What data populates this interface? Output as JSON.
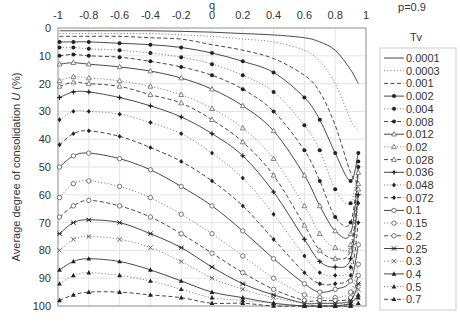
{
  "chart_data": {
    "type": "line",
    "title": "",
    "annotation": "p=0.9",
    "xlabel": "q",
    "ylabel": "Average degree of consolidation U (%)",
    "xlim": [
      -1,
      1
    ],
    "ylim": [
      100,
      0
    ],
    "y_inverted": true,
    "x_axis_position": "top",
    "x_ticks": [
      "-1",
      "-0.8",
      "-0.6",
      "-0.4",
      "-0.2",
      "0",
      "0.2",
      "0.4",
      "0.6",
      "0.8",
      "1"
    ],
    "y_ticks": [
      "0",
      "10",
      "20",
      "30",
      "40",
      "50",
      "60",
      "70",
      "80",
      "90",
      "100"
    ],
    "grid": true,
    "legend_title": "Tv",
    "legend_position": "right",
    "x": [
      -0.99,
      -0.9,
      -0.8,
      -0.6,
      -0.4,
      -0.2,
      0,
      0.2,
      0.4,
      0.6,
      0.7,
      0.8,
      0.9,
      0.95
    ],
    "series": [
      {
        "name": "0.0001",
        "style": "solid",
        "marker": "none",
        "values": [
          1,
          1,
          1,
          1,
          1,
          1.2,
          1.5,
          2,
          2.5,
          3.5,
          5,
          8,
          15,
          20
        ]
      },
      {
        "name": "0.0003",
        "style": "dotted",
        "marker": "none",
        "values": [
          2,
          2,
          2,
          2,
          2,
          2.5,
          3,
          4,
          5,
          8,
          12,
          20,
          33,
          37
        ]
      },
      {
        "name": "0.001",
        "style": "dashed",
        "marker": "none",
        "values": [
          3,
          3,
          3,
          3,
          3.5,
          4,
          6,
          8,
          11,
          17,
          23,
          35,
          52,
          56
        ]
      },
      {
        "name": "0.002",
        "style": "solid",
        "marker": "circle-filled",
        "values": [
          5,
          5,
          5,
          5.5,
          6,
          7,
          9,
          12,
          16,
          25,
          33,
          45,
          55,
          45
        ]
      },
      {
        "name": "0.004",
        "style": "dotted",
        "marker": "circle-filled",
        "values": [
          7,
          7,
          7.5,
          8,
          9,
          10.5,
          13,
          17,
          23,
          35,
          44,
          58,
          63,
          48
        ]
      },
      {
        "name": "0.008",
        "style": "dashed",
        "marker": "circle-filled",
        "values": [
          10,
          9.5,
          10,
          10.5,
          12,
          14,
          17,
          22,
          30,
          44,
          55,
          68,
          70,
          50
        ]
      },
      {
        "name": "0.012",
        "style": "solid",
        "marker": "triangle-hollow",
        "values": [
          13,
          12.5,
          13,
          14,
          15.5,
          18,
          22,
          28,
          37,
          53,
          64,
          73,
          74,
          52
        ]
      },
      {
        "name": "0.02",
        "style": "dotted",
        "marker": "triangle-hollow",
        "values": [
          19,
          17.5,
          18,
          19,
          21,
          24,
          29,
          36,
          47,
          64,
          74,
          79,
          78,
          56
        ]
      },
      {
        "name": "0.028",
        "style": "dashed",
        "marker": "triangle-hollow",
        "values": [
          21,
          19.5,
          20,
          21,
          24,
          27,
          33,
          41,
          53,
          71,
          80,
          83,
          80,
          58
        ]
      },
      {
        "name": "0.036",
        "style": "solid",
        "marker": "plus",
        "values": [
          25,
          23,
          23,
          25,
          28,
          32,
          38,
          46,
          59,
          76,
          84,
          86,
          83,
          60
        ]
      },
      {
        "name": "0.048",
        "style": "dotted",
        "marker": "diamond-filled",
        "values": [
          33,
          30,
          30,
          31,
          34,
          38,
          45,
          54,
          67,
          82,
          88,
          89,
          86,
          63
        ]
      },
      {
        "name": "0.072",
        "style": "dashed",
        "marker": "diamond-filled",
        "values": [
          42,
          38,
          37,
          39,
          43,
          48,
          55,
          64,
          76,
          88,
          92,
          92,
          89,
          70
        ]
      },
      {
        "name": "0.1",
        "style": "solid",
        "marker": "circle-hollow",
        "values": [
          50,
          46,
          45,
          47,
          51,
          57,
          64,
          73,
          83,
          92,
          95,
          94,
          91,
          78
        ]
      },
      {
        "name": "0.15",
        "style": "dotted",
        "marker": "circle-hollow",
        "values": [
          61,
          56,
          55,
          57,
          61,
          67,
          74,
          82,
          90,
          96,
          97,
          97,
          95,
          85
        ]
      },
      {
        "name": "0.2",
        "style": "dashed",
        "marker": "circle-hollow",
        "values": [
          68,
          64,
          62,
          64,
          68,
          74,
          81,
          88,
          94,
          98,
          98,
          98,
          97,
          89
        ]
      },
      {
        "name": "0.25",
        "style": "solid",
        "marker": "cross",
        "values": [
          74,
          70,
          69,
          70,
          74,
          79,
          86,
          92,
          96,
          99,
          99,
          99,
          98,
          92
        ]
      },
      {
        "name": "0.3",
        "style": "dotted",
        "marker": "x",
        "values": [
          80,
          76,
          75,
          76,
          79,
          84,
          90,
          94,
          97,
          99,
          99,
          99,
          99,
          94
        ]
      },
      {
        "name": "0.4",
        "style": "solid",
        "marker": "triangle-filled",
        "values": [
          87,
          84,
          83,
          84,
          87,
          91,
          95,
          97,
          99,
          100,
          100,
          100,
          99,
          96
        ]
      },
      {
        "name": "0.5",
        "style": "dotted",
        "marker": "triangle-filled",
        "values": [
          92,
          89,
          88,
          89,
          91,
          94,
          97,
          98,
          99,
          100,
          100,
          100,
          100,
          97
        ]
      },
      {
        "name": "0.7",
        "style": "dashed",
        "marker": "triangle-filled",
        "values": [
          98,
          96,
          95,
          95,
          96,
          97,
          99,
          99,
          100,
          100,
          100,
          100,
          100,
          99
        ]
      }
    ]
  }
}
